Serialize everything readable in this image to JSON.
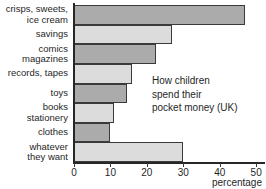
{
  "chart_data": {
    "type": "bar",
    "orientation": "horizontal",
    "title": "",
    "xlabel": "percentage",
    "ylabel": "",
    "xlim": [
      0,
      52.7
    ],
    "grid": false,
    "legend": null,
    "tick_labels": [
      "0",
      "10",
      "20",
      "30",
      "40",
      "50"
    ],
    "ticks": [
      0,
      10,
      20,
      30,
      40,
      50
    ],
    "categories": [
      "crisps, sweets, ice cream",
      "savings",
      "comics magazines",
      "records, tapes",
      "toys",
      "books stationery",
      "clothes",
      "whatever they want"
    ],
    "values": [
      47,
      27,
      22.5,
      16,
      14.5,
      11,
      10,
      30
    ],
    "colors": {
      "bar_dark": "#ababab",
      "bar_light": "#dcdcdc",
      "bar_border": "#3a3a3a",
      "axis": "#262626",
      "text": "#1f1f1f",
      "background": "#ffffff"
    },
    "annotation": {
      "lines": [
        "How children",
        "spend their",
        "pocket money (UK)"
      ]
    }
  },
  "labels": {
    "row0": {
      "line1": "crisps, sweets,",
      "line2": "ice cream"
    },
    "row1": {
      "line1": "savings",
      "line2": ""
    },
    "row2": {
      "line1": "comics",
      "line2": "magazines"
    },
    "row3": {
      "line1": "records, tapes",
      "line2": ""
    },
    "row4": {
      "line1": "toys",
      "line2": ""
    },
    "row5": {
      "line1": "books",
      "line2": "stationery"
    },
    "row6": {
      "line1": "clothes",
      "line2": ""
    },
    "row7": {
      "line1": "whatever",
      "line2": "they want"
    }
  },
  "axis": {
    "tick0": "0",
    "tick1": "10",
    "tick2": "20",
    "tick3": "30",
    "tick4": "40",
    "tick5": "50",
    "title": "percentage"
  },
  "annotation": {
    "line1": "How children",
    "line2": "spend their",
    "line3": "pocket money (UK)"
  }
}
